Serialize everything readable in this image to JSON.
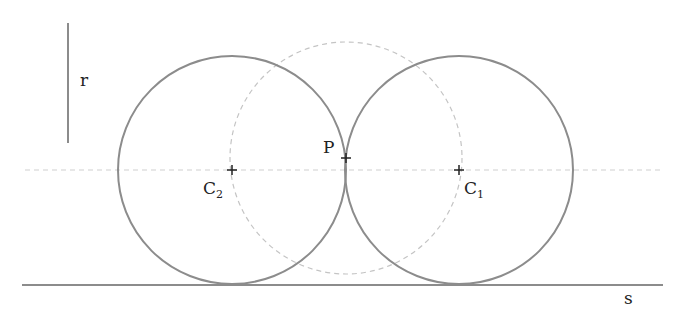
{
  "diagram": {
    "labels": {
      "radius": "r",
      "point": "P",
      "center1": "C",
      "center1_sub": "1",
      "center2": "C",
      "center2_sub": "2",
      "line": "s"
    },
    "colors": {
      "solid": "#8c8c8c",
      "dashed": "#c4c4c4",
      "text": "#222222"
    },
    "elements": {
      "radius_segment": {
        "x": 68,
        "y1": 23,
        "y2": 143
      },
      "circle_c2": {
        "cx": 232,
        "cy": 170,
        "r": 114
      },
      "circle_c1": {
        "cx": 459,
        "cy": 170,
        "r": 114
      },
      "circle_p_dashed": {
        "cx": 346,
        "cy": 158,
        "r": 116
      },
      "axis_dashed": {
        "y": 170,
        "x1": 25,
        "x2": 662
      },
      "line_s": {
        "y": 285,
        "x1": 22,
        "x2": 663
      },
      "point_p": {
        "x": 346,
        "y": 158
      }
    }
  }
}
